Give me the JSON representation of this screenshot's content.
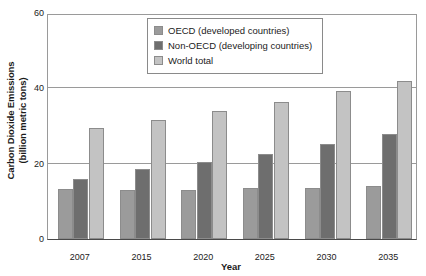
{
  "chart_data": {
    "type": "bar",
    "title": "",
    "xlabel": "Year",
    "ylabel": "Carbon Dioxide Emissions\n(billion metric tons)",
    "ylabel_line1": "Carbon Dioxide Emissions",
    "ylabel_line2": "(billion metric tons)",
    "categories": [
      "2007",
      "2015",
      "2020",
      "2025",
      "2030",
      "2035"
    ],
    "ylim": [
      0,
      60
    ],
    "yticks": [
      0,
      20,
      40,
      60
    ],
    "ytick_labels": [
      "0",
      "20",
      "40",
      "60"
    ],
    "grid": "horizontal",
    "legend_position": "top-center",
    "series": [
      {
        "name": "OECD (developed countries)",
        "color": "#9b9b9b",
        "values": [
          13.3,
          13.0,
          13.0,
          13.5,
          13.5,
          14.0
        ]
      },
      {
        "name": "Non-OECD (developing countries)",
        "color": "#6e6e6e",
        "values": [
          16.0,
          18.5,
          20.5,
          22.5,
          25.3,
          28.0
        ]
      },
      {
        "name": "World total",
        "color": "#c3c3c3",
        "values": [
          29.6,
          31.5,
          34.0,
          36.5,
          39.3,
          42.0
        ]
      }
    ]
  },
  "legend": {
    "items": [
      {
        "label": "OECD (developed countries)",
        "swatch": "#9b9b9b"
      },
      {
        "label": "Non-OECD (developing countries)",
        "swatch": "#6e6e6e"
      },
      {
        "label": "World total",
        "swatch": "#c3c3c3"
      }
    ]
  },
  "colors": {
    "oecd": "#9b9b9b",
    "non_oecd": "#6e6e6e",
    "world_total": "#c3c3c3",
    "axis": "#4a4a4a",
    "grid": "#9a9a9a",
    "text": "#1b1b1b",
    "background": "#ffffff"
  }
}
